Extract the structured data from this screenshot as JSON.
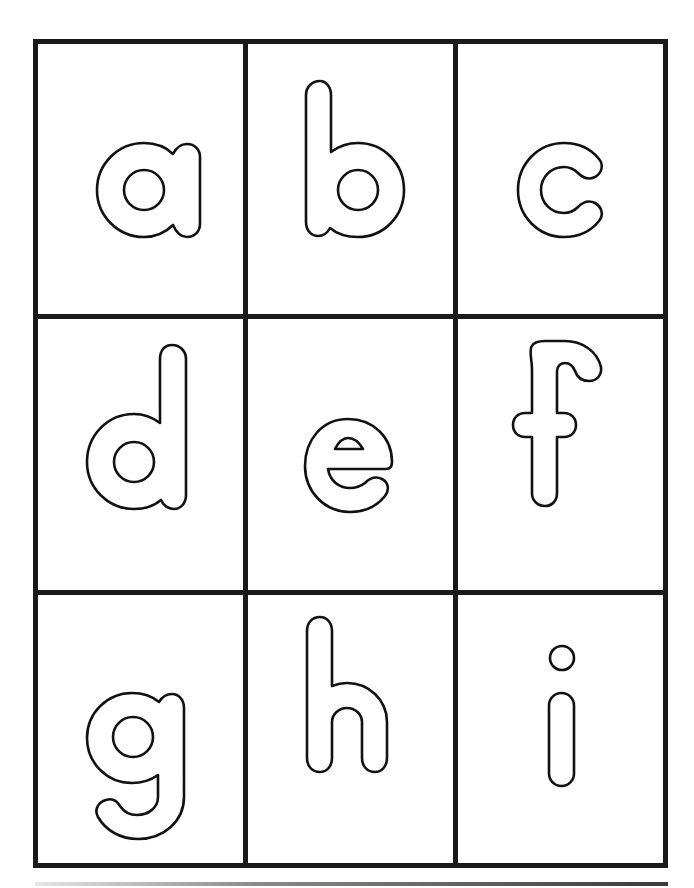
{
  "worksheet": {
    "layout": "3x3 letter grid",
    "grid": {
      "rows": 3,
      "columns": 3,
      "line_color": "#1a1a1a"
    },
    "letters": [
      {
        "letter": "a",
        "row": 1,
        "col": 1
      },
      {
        "letter": "b",
        "row": 1,
        "col": 2
      },
      {
        "letter": "c",
        "row": 1,
        "col": 3
      },
      {
        "letter": "d",
        "row": 2,
        "col": 1
      },
      {
        "letter": "e",
        "row": 2,
        "col": 2
      },
      {
        "letter": "f",
        "row": 2,
        "col": 3
      },
      {
        "letter": "g",
        "row": 3,
        "col": 1
      },
      {
        "letter": "h",
        "row": 3,
        "col": 2
      },
      {
        "letter": "i",
        "row": 3,
        "col": 3
      }
    ],
    "letter_style": "outlined lowercase (bubble letters)",
    "colors": {
      "outline": "#111111",
      "fill": "#ffffff",
      "background": "#ffffff"
    }
  }
}
